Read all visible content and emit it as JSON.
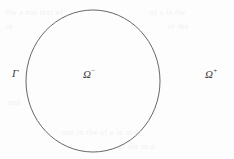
{
  "figure": {
    "background_color": "#fdfdfd",
    "stroke_color": "#565656",
    "text_color": "#3b3b3b"
  },
  "boundary": {
    "name": "interface-curve",
    "shape": "ellipse",
    "center_x": 93,
    "center_y": 81,
    "radius_x": 67,
    "radius_y": 71,
    "stroke_width": 0.9
  },
  "labels": {
    "gamma": {
      "symbol": "Γ",
      "sign": ""
    },
    "omega_minus": {
      "symbol": "Ω",
      "sign": "−"
    },
    "omega_plus": {
      "symbol": "Ω",
      "sign": "+"
    }
  },
  "ghost_text": {
    "top_left": "the  a  not  text  of",
    "top_right": "of  a  is  the",
    "mid_left": "in",
    "mid_right": "of  the",
    "bottom_left": "and",
    "bottom_mid": "one  in  the  of  a  in  and",
    "bottom_right": "of  the  in  a"
  }
}
